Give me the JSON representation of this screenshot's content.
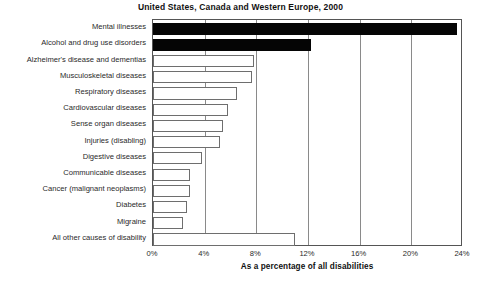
{
  "chart_data": {
    "type": "bar",
    "orientation": "horizontal",
    "title": "United States, Canada and Western Europe, 2000",
    "xlabel": "As a percentage of all disabilities",
    "ylabel": "",
    "xlim": [
      0,
      24
    ],
    "xticks": [
      "0%",
      "4%",
      "8%",
      "12%",
      "16%",
      "20%",
      "24%"
    ],
    "xtick_values": [
      0,
      4,
      8,
      12,
      16,
      20,
      24
    ],
    "grid": true,
    "legend": false,
    "categories": [
      "Mental illnesses",
      "Alcohol and drug use disorders",
      "Alzheimer's disease and dementias",
      "Musculoskeletal diseases",
      "Respiratory diseases",
      "Cardiovascular diseases",
      "Sense organ diseases",
      "Injuries (disabling)",
      "Digestive diseases",
      "Communicable diseases",
      "Cancer (malignant neoplasms)",
      "Diabetes",
      "Migraine",
      "All other causes of disability"
    ],
    "values": [
      23.5,
      12.2,
      7.8,
      7.7,
      6.5,
      5.8,
      5.4,
      5.2,
      3.8,
      2.9,
      2.9,
      2.6,
      2.3,
      11.0
    ],
    "bar_styles": [
      "filled",
      "filled",
      "outline",
      "outline",
      "outline",
      "outline",
      "outline",
      "outline",
      "outline",
      "outline",
      "outline",
      "outline",
      "outline",
      "outline"
    ],
    "colors": {
      "filled": "#050505",
      "outline_fill": "#ffffff",
      "outline_stroke": "#6e6e6e",
      "axis": "#555555",
      "gridline": "#8a8a8a",
      "text": "#1a1a1a",
      "background": "#ffffff"
    }
  }
}
